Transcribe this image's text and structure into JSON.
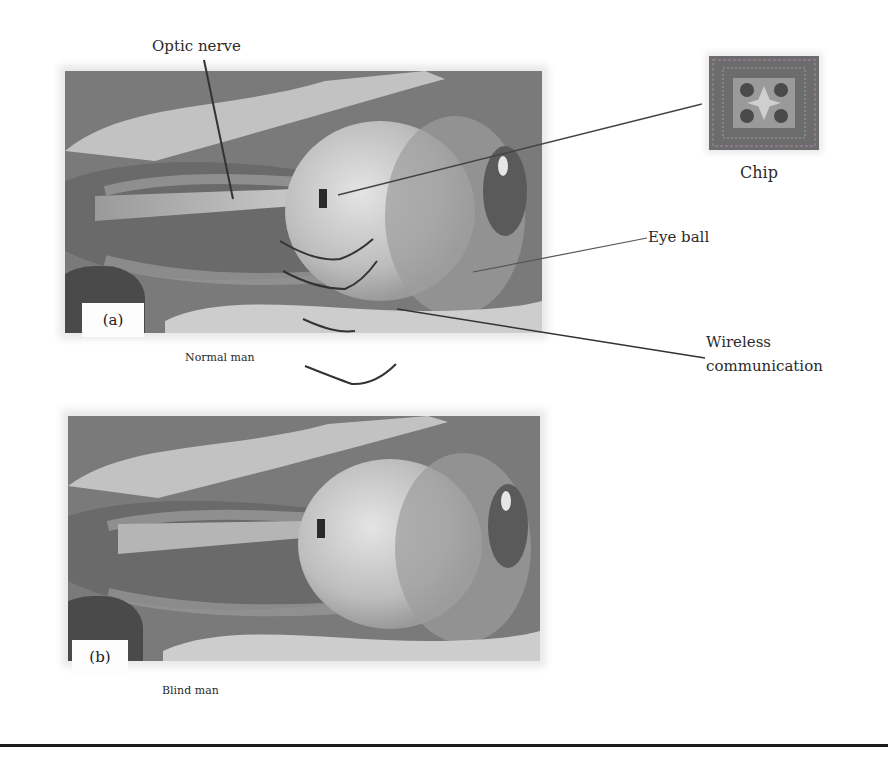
{
  "figure": {
    "panels": [
      {
        "tag": "(a)",
        "caption": "Normal man"
      },
      {
        "tag": "(b)",
        "caption": "Blind man"
      }
    ],
    "labels": {
      "optic_nerve": "Optic nerve",
      "chip": "Chip",
      "eye_ball": "Eye ball",
      "wireless_line1": "Wireless",
      "wireless_line2": "communication"
    },
    "colors": {
      "background": "#ffffff",
      "panel_gray": "#7e7e7e",
      "leader_line": "#3a3a3a",
      "divider": "#1b1b1b"
    }
  }
}
